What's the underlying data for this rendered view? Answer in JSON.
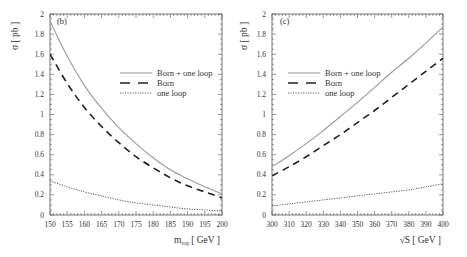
{
  "chart_data": [
    {
      "type": "line",
      "panel_tag": "(b)",
      "title": "",
      "xlabel": "m_top [ GeV ]",
      "xlabel_main": "m",
      "xlabel_sub": "top",
      "xlabel_unit": "[ GeV ]",
      "ylabel": "σ [ pb ]",
      "xlim": [
        150,
        200
      ],
      "ylim": [
        0,
        2
      ],
      "xticks": [
        150,
        155,
        160,
        165,
        170,
        175,
        180,
        185,
        190,
        195,
        200
      ],
      "yticks": [
        0,
        0.2,
        0.4,
        0.6,
        0.8,
        1,
        1.2,
        1.4,
        1.6,
        1.8,
        2
      ],
      "grid": false,
      "legend_position": "upper right",
      "x": [
        150,
        155,
        160,
        165,
        170,
        175,
        180,
        185,
        190,
        195,
        200
      ],
      "series": [
        {
          "name": "Born + one loop",
          "style": "solid",
          "color": "#9a9a9a",
          "values": [
            1.93,
            1.58,
            1.29,
            1.06,
            0.87,
            0.71,
            0.57,
            0.45,
            0.36,
            0.28,
            0.21
          ]
        },
        {
          "name": "Born",
          "style": "dashed",
          "color": "#222222",
          "values": [
            1.6,
            1.31,
            1.07,
            0.88,
            0.72,
            0.58,
            0.47,
            0.37,
            0.29,
            0.23,
            0.17
          ]
        },
        {
          "name": "one loop",
          "style": "dotted",
          "color": "#444444",
          "values": [
            0.34,
            0.28,
            0.23,
            0.19,
            0.15,
            0.12,
            0.1,
            0.08,
            0.06,
            0.05,
            0.04
          ]
        }
      ]
    },
    {
      "type": "line",
      "panel_tag": "(c)",
      "title": "",
      "xlabel": "√S [ GeV ]",
      "xlabel_main": "√S",
      "xlabel_sub": "",
      "xlabel_unit": "[ GeV ]",
      "ylabel": "σ [ pb ]",
      "xlim": [
        300,
        400
      ],
      "ylim": [
        0,
        2
      ],
      "xticks": [
        300,
        310,
        320,
        330,
        340,
        350,
        360,
        370,
        380,
        390,
        400
      ],
      "yticks": [
        0,
        0.2,
        0.4,
        0.6,
        0.8,
        1,
        1.2,
        1.4,
        1.6,
        1.8,
        2
      ],
      "grid": false,
      "legend_position": "upper left",
      "x": [
        300,
        310,
        320,
        330,
        340,
        350,
        360,
        370,
        380,
        390,
        400
      ],
      "series": [
        {
          "name": "Born + one loop",
          "style": "solid",
          "color": "#9a9a9a",
          "values": [
            0.48,
            0.59,
            0.71,
            0.84,
            0.98,
            1.12,
            1.27,
            1.42,
            1.56,
            1.71,
            1.87
          ]
        },
        {
          "name": "Born",
          "style": "dashed",
          "color": "#222222",
          "values": [
            0.39,
            0.48,
            0.58,
            0.69,
            0.8,
            0.92,
            1.04,
            1.17,
            1.3,
            1.43,
            1.56
          ]
        },
        {
          "name": "one loop",
          "style": "dotted",
          "color": "#444444",
          "values": [
            0.09,
            0.11,
            0.13,
            0.15,
            0.17,
            0.19,
            0.21,
            0.23,
            0.25,
            0.28,
            0.31
          ]
        }
      ]
    }
  ]
}
